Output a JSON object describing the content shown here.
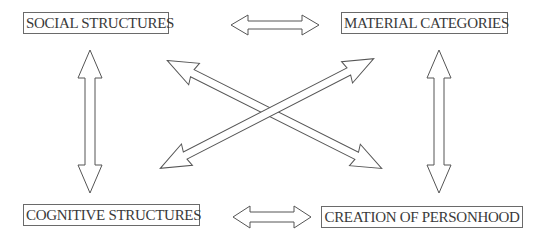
{
  "diagram": {
    "nodes": [
      {
        "id": "social",
        "label": "SOCIAL STRUCTURES",
        "x": 23,
        "y": 12,
        "w": 146
      },
      {
        "id": "material",
        "label": "MATERIAL CATEGORIES",
        "x": 341,
        "y": 12,
        "w": 167
      },
      {
        "id": "cognitive",
        "label": "COGNITIVE STRUCTURES",
        "x": 23,
        "y": 204,
        "w": 177
      },
      {
        "id": "personhood",
        "label": "CREATION OF PERSONHOOD",
        "x": 321,
        "y": 206,
        "w": 202
      }
    ],
    "edges": [
      {
        "from": "social",
        "to": "material",
        "type": "bidirectional"
      },
      {
        "from": "cognitive",
        "to": "personhood",
        "type": "bidirectional"
      },
      {
        "from": "social",
        "to": "cognitive",
        "type": "bidirectional"
      },
      {
        "from": "material",
        "to": "personhood",
        "type": "bidirectional"
      },
      {
        "from": "social",
        "to": "personhood",
        "type": "bidirectional"
      },
      {
        "from": "cognitive",
        "to": "material",
        "type": "bidirectional"
      }
    ],
    "colors": {
      "stroke": "#555555",
      "text": "#3a3a3a",
      "background": "#ffffff"
    }
  }
}
